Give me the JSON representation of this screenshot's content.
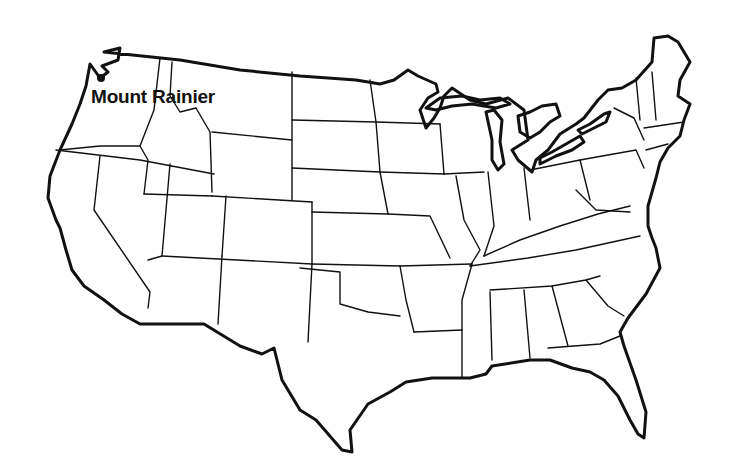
{
  "map": {
    "subject": "Contiguous United States outline map",
    "style": "black-and-white line art",
    "colors": {
      "line": "#111111",
      "background": "#ffffff"
    }
  },
  "markers": [
    {
      "label": "Mount Rainier",
      "icon": "point-dot",
      "x": 100,
      "y": 78
    }
  ]
}
